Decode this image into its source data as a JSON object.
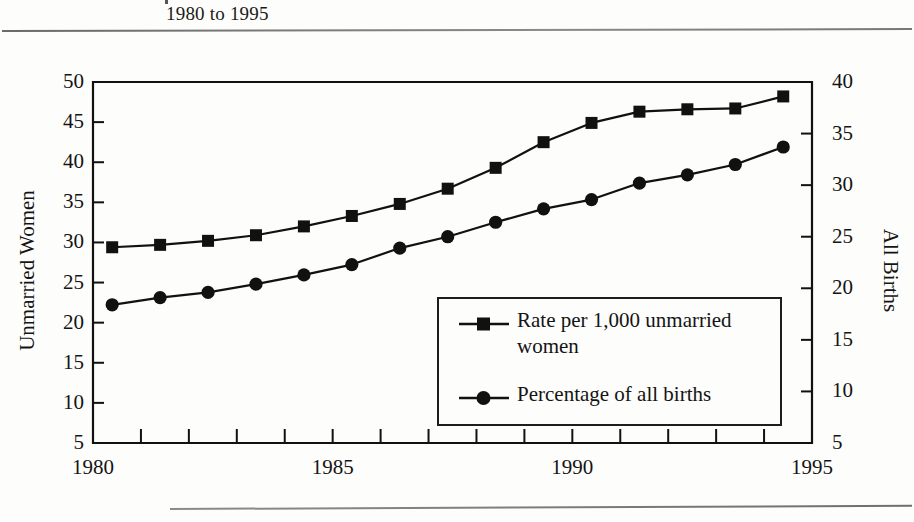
{
  "header": {
    "subtitle": "1980 to 1995"
  },
  "chart_data": {
    "type": "line",
    "title": "1980 to 1995",
    "xlabel": "",
    "ylabel": "Unmarried Women",
    "y2label": "All Births",
    "xlim": [
      1980,
      1995
    ],
    "ylim": [
      5,
      50
    ],
    "y2lim": [
      5,
      40
    ],
    "grid": false,
    "legend_position": "center-right-inside",
    "x_tick_labels": [
      "1980",
      "1985",
      "1990",
      "1995"
    ],
    "x_tick_values": [
      1980,
      1985,
      1990,
      1995
    ],
    "x_minor_ticks": [
      1981,
      1982,
      1983,
      1984,
      1986,
      1987,
      1988,
      1989,
      1991,
      1992,
      1993,
      1994
    ],
    "y_tick_labels": [
      "50",
      "45",
      "40",
      "35",
      "30",
      "25",
      "20",
      "15",
      "10",
      "5"
    ],
    "y_tick_values": [
      50,
      45,
      40,
      35,
      30,
      25,
      20,
      15,
      10,
      5
    ],
    "y2_tick_labels": [
      "40",
      "35",
      "30",
      "25",
      "20",
      "15",
      "10",
      "5"
    ],
    "y2_tick_values": [
      40,
      35,
      30,
      25,
      20,
      15,
      10,
      5
    ],
    "x": [
      1980.4,
      1981.4,
      1982.4,
      1983.4,
      1984.4,
      1985.4,
      1986.4,
      1987.4,
      1988.4,
      1989.4,
      1990.4,
      1991.4,
      1992.4,
      1993.4,
      1994.4
    ],
    "series": [
      {
        "name": "Rate per 1,000 unmarried women",
        "marker": "square",
        "axis": "left",
        "color": "#111111",
        "values": [
          29.4,
          29.7,
          30.2,
          30.9,
          32.0,
          33.3,
          34.8,
          36.7,
          39.3,
          42.5,
          44.9,
          46.3,
          46.6,
          46.7,
          48.2
        ]
      },
      {
        "name": "Percentage of all births",
        "marker": "circle",
        "axis": "right",
        "color": "#111111",
        "values": [
          18.4,
          19.1,
          19.6,
          20.4,
          21.3,
          22.3,
          23.9,
          25.0,
          26.4,
          27.7,
          28.6,
          30.2,
          31.0,
          32.0,
          33.7
        ]
      }
    ]
  },
  "legend": {
    "items": [
      {
        "label": "Rate per 1,000 unmarried women",
        "marker": "square"
      },
      {
        "label": "Percentage of all births",
        "marker": "circle"
      }
    ]
  },
  "colors": {
    "ink": "#111111",
    "rule": "#7a7a7a",
    "paper": "#fdfdfb"
  }
}
